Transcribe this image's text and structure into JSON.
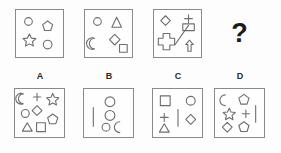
{
  "puzzle": {
    "type": "visual-analogy-matrix",
    "colors": {
      "background": "#fdfdfd",
      "panel_border": "#8a8a8a",
      "shape_stroke": "#6e6e6e",
      "label_text": "#2b2b2b",
      "question_mark": "#1a1a1a"
    },
    "question_mark": "?",
    "prompt_panels": [
      {
        "name": "panel-1",
        "shapes": [
          {
            "icon": "circle-icon",
            "cx": 13,
            "cy": 12,
            "r": 4
          },
          {
            "icon": "pentagon-icon",
            "cx": 33,
            "cy": 17,
            "r": 5.5
          },
          {
            "icon": "star-icon",
            "cx": 14,
            "cy": 31,
            "r": 6
          },
          {
            "icon": "circle-icon",
            "cx": 33,
            "cy": 36,
            "r": 4.5
          }
        ]
      },
      {
        "name": "panel-2",
        "shapes": [
          {
            "icon": "circle-icon",
            "cx": 13,
            "cy": 12,
            "r": 4
          },
          {
            "icon": "triangle-icon",
            "cx": 33,
            "cy": 13,
            "r": 6
          },
          {
            "icon": "crescent-moon-icon",
            "cx": 13,
            "cy": 35,
            "r": 6
          },
          {
            "icon": "diamond-icon",
            "cx": 31,
            "cy": 31,
            "r": 5.5
          },
          {
            "icon": "square-icon",
            "cx": 40,
            "cy": 40,
            "r": 4
          }
        ]
      },
      {
        "name": "panel-3",
        "shapes": [
          {
            "icon": "diamond-icon",
            "cx": 12,
            "cy": 11,
            "r": 5
          },
          {
            "icon": "plus-icon",
            "cx": 36,
            "cy": 9,
            "r": 4.5
          },
          {
            "icon": "rectangle-icon",
            "cx": 36,
            "cy": 18,
            "r": 6
          },
          {
            "icon": "cross-icon",
            "cx": 13,
            "cy": 33,
            "r": 9
          },
          {
            "icon": "diagonal-line-icon",
            "cx": 28,
            "cy": 27,
            "r": 11
          },
          {
            "icon": "up-arrow-icon",
            "cx": 37,
            "cy": 38,
            "r": 6
          }
        ]
      }
    ],
    "options": [
      {
        "label": "A",
        "name": "option-a",
        "shapes": [
          {
            "icon": "crescent-moon-icon",
            "cx": 10,
            "cy": 10,
            "r": 5.5
          },
          {
            "icon": "plus-icon",
            "cx": 22,
            "cy": 8,
            "r": 4
          },
          {
            "icon": "star-icon",
            "cx": 38,
            "cy": 10,
            "r": 5.5
          },
          {
            "icon": "circle-icon",
            "cx": 10,
            "cy": 25,
            "r": 4
          },
          {
            "icon": "diamond-icon",
            "cx": 22,
            "cy": 22,
            "r": 5
          },
          {
            "icon": "pentagon-icon",
            "cx": 38,
            "cy": 31,
            "r": 5.5
          },
          {
            "icon": "triangle-icon",
            "cx": 12,
            "cy": 39,
            "r": 5
          },
          {
            "icon": "square-icon",
            "cx": 26,
            "cy": 39,
            "r": 4.5
          }
        ]
      },
      {
        "label": "B",
        "name": "option-b",
        "shapes": [
          {
            "icon": "vertical-line-icon",
            "cx": 9,
            "cy": 28,
            "r": 10
          },
          {
            "icon": "circle-icon",
            "cx": 26,
            "cy": 13,
            "r": 5
          },
          {
            "icon": "circle-icon",
            "cx": 26,
            "cy": 27,
            "r": 5
          },
          {
            "icon": "circle-icon",
            "cx": 22,
            "cy": 39,
            "r": 4
          },
          {
            "icon": "crescent-moon-icon",
            "cx": 38,
            "cy": 39,
            "r": 5.5
          }
        ]
      },
      {
        "label": "C",
        "name": "option-c",
        "shapes": [
          {
            "icon": "square-icon",
            "cx": 12,
            "cy": 12,
            "r": 5
          },
          {
            "icon": "circle-icon",
            "cx": 38,
            "cy": 12,
            "r": 4.5
          },
          {
            "icon": "plus-icon",
            "cx": 11,
            "cy": 29,
            "r": 4.5
          },
          {
            "icon": "vertical-line-icon",
            "cx": 25,
            "cy": 29,
            "r": 9
          },
          {
            "icon": "diamond-icon",
            "cx": 38,
            "cy": 31,
            "r": 5
          },
          {
            "icon": "triangle-icon",
            "cx": 11,
            "cy": 40,
            "r": 5
          }
        ]
      },
      {
        "label": "D",
        "name": "option-d",
        "shapes": [
          {
            "icon": "crescent-moon-icon",
            "cx": 12,
            "cy": 11,
            "r": 5.5
          },
          {
            "icon": "pentagon-icon",
            "cx": 29,
            "cy": 11,
            "r": 5.5
          },
          {
            "icon": "star-icon",
            "cx": 14,
            "cy": 25,
            "r": 5.5
          },
          {
            "icon": "plus-icon",
            "cx": 31,
            "cy": 25,
            "r": 4
          },
          {
            "icon": "vertical-line-icon",
            "cx": 41,
            "cy": 25,
            "r": 9
          },
          {
            "icon": "diamond-icon",
            "cx": 12,
            "cy": 39,
            "r": 5
          },
          {
            "icon": "pentagon-icon",
            "cx": 29,
            "cy": 39,
            "r": 5
          }
        ]
      }
    ]
  }
}
